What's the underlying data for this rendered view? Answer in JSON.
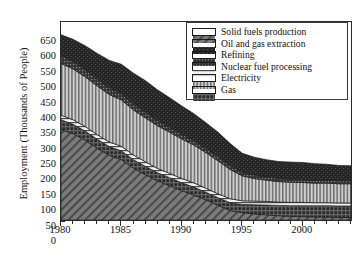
{
  "chart_data": {
    "type": "area",
    "stacked": true,
    "title": "",
    "xlabel": "",
    "ylabel": "Employment (Thousands of People)",
    "xlim": [
      1980,
      2004
    ],
    "ylim": [
      0,
      650
    ],
    "ytick_step": 50,
    "grid": false,
    "legend_position": "top-right",
    "x": [
      1980,
      1981,
      1982,
      1983,
      1984,
      1985,
      1986,
      1987,
      1988,
      1989,
      1990,
      1991,
      1992,
      1993,
      1994,
      1995,
      1996,
      1997,
      1998,
      1999,
      2000,
      2001,
      2002,
      2003,
      2004
    ],
    "xtick_labels": [
      "1980",
      "1985",
      "1990",
      "1995",
      "2000"
    ],
    "xtick_values": [
      1980,
      1985,
      1990,
      1995,
      2000
    ],
    "ytick_labels": [
      "0",
      "50",
      "100",
      "150",
      "200",
      "250",
      "300",
      "350",
      "400",
      "450",
      "500",
      "550",
      "600",
      "650"
    ],
    "series": [
      {
        "name": "Solid fuels production",
        "pattern": "diagonal-hatch",
        "color": "#6f6f6f",
        "values": [
          297,
          283,
          262,
          235,
          212,
          198,
          170,
          148,
          128,
          112,
          96,
          82,
          66,
          48,
          31,
          24,
          20,
          17,
          14,
          12,
          11,
          10,
          9,
          8,
          8
        ]
      },
      {
        "name": "Gas",
        "pattern": "dense-cross-hatch",
        "color": "#2e2e2e",
        "values": [
          32,
          31,
          30,
          30,
          29,
          29,
          28,
          28,
          27,
          27,
          26,
          26,
          25,
          25,
          26,
          27,
          30,
          32,
          34,
          35,
          36,
          37,
          38,
          38,
          38
        ]
      },
      {
        "name": "Nuclear fuel processing",
        "pattern": "horizontal-lines",
        "color": "#dcdcdc",
        "values": [
          15,
          15,
          15,
          15,
          15,
          15,
          15,
          15,
          14,
          14,
          14,
          14,
          13,
          13,
          13,
          12,
          12,
          12,
          11,
          11,
          11,
          10,
          10,
          10,
          10
        ]
      },
      {
        "name": "Electricity",
        "pattern": "vertical-lines",
        "color": "#b6b6b6",
        "values": [
          170,
          167,
          163,
          160,
          156,
          152,
          148,
          144,
          140,
          135,
          130,
          124,
          117,
          108,
          96,
          82,
          74,
          70,
          67,
          66,
          65,
          64,
          64,
          63,
          63
        ]
      },
      {
        "name": "Refining",
        "pattern": "fine-dot-dark",
        "color": "#3c3c3c",
        "values": [
          26,
          25,
          24,
          23,
          22,
          21,
          20,
          19,
          18,
          17,
          16,
          15,
          14,
          14,
          13,
          12,
          12,
          11,
          11,
          11,
          10,
          10,
          10,
          10,
          10
        ]
      },
      {
        "name": "Oil and gas extraction",
        "pattern": "solid-dark",
        "color": "#232323",
        "values": [
          68,
          72,
          78,
          84,
          90,
          96,
          101,
          103,
          100,
          96,
          92,
          88,
          84,
          80,
          72,
          62,
          58,
          56,
          55,
          55,
          56,
          54,
          52,
          50,
          49
        ]
      }
    ],
    "stack_order_bottom_to_top": [
      "Solid fuels production",
      "Gas",
      "Nuclear fuel processing",
      "Electricity",
      "Refining",
      "Oil and gas extraction"
    ]
  },
  "legend": {
    "items": [
      {
        "label": "Solid fuels production",
        "pattern": "diagonal-hatch"
      },
      {
        "label": "Oil and gas extraction",
        "pattern": "solid-dark"
      },
      {
        "label": "Refining",
        "pattern": "fine-dot-dark"
      },
      {
        "label": "Nuclear fuel processing",
        "pattern": "horizontal-lines"
      },
      {
        "label": "Electricity",
        "pattern": "vertical-lines"
      },
      {
        "label": "Gas",
        "pattern": "dense-cross-hatch"
      }
    ]
  },
  "axes": {
    "y_title": "Employment (Thousands of People)"
  }
}
